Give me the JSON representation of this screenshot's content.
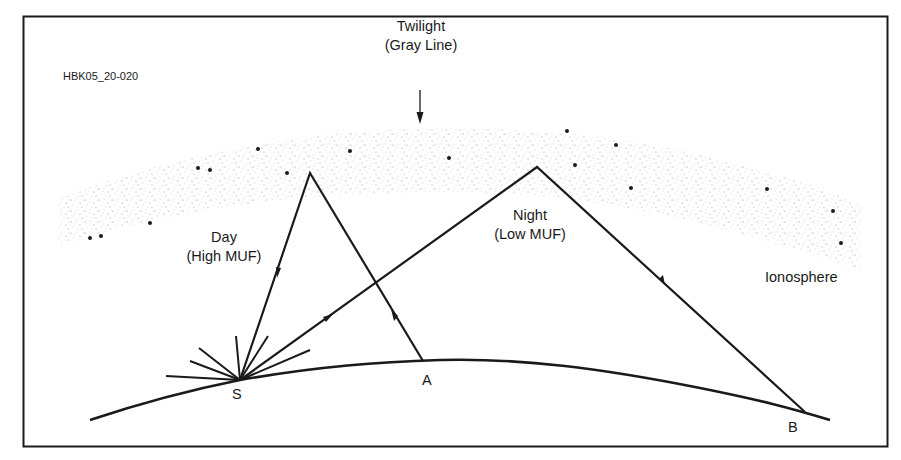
{
  "figure": {
    "id_label": "HBK05_20-020",
    "twilight_line1": "Twilight",
    "twilight_line2": "(Gray Line)",
    "day_line1": "Day",
    "day_line2": "(High MUF)",
    "night_line1": "Night",
    "night_line2": "(Low MUF)",
    "ionosphere_label": "Ionosphere",
    "points": {
      "s": "S",
      "a": "A",
      "b": "B"
    }
  },
  "colors": {
    "line": "#1a1a1a",
    "stipple": "#8a8a8a",
    "background": "#ffffff"
  }
}
